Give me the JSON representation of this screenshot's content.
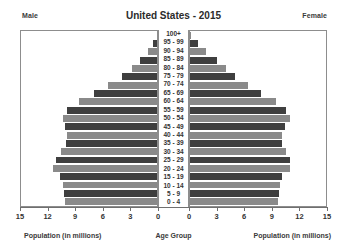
{
  "header": {
    "title": "United States - 2015",
    "male_label": "Male",
    "female_label": "Female"
  },
  "axis": {
    "left_caption": "Population (in millions)",
    "center_caption": "Age Group",
    "right_caption": "Population (in millions)",
    "ticks": [
      15,
      12,
      9,
      6,
      3,
      0
    ],
    "tick_labels_left": [
      "15",
      "12",
      "9",
      "6",
      "3",
      "0"
    ],
    "tick_labels_right": [
      "0",
      "3",
      "6",
      "9",
      "12",
      "15"
    ],
    "max": 15,
    "step": 3
  },
  "colors": {
    "bar_dark": "#3f3f3f",
    "bar_light": "#8a8a8a",
    "frame": "#8d8d8d",
    "background": "#ffffff",
    "text": "#333333"
  },
  "chart_data": {
    "type": "bar",
    "subtype": "population-pyramid",
    "title": "United States - 2015",
    "xlabel": "Population (in millions)",
    "ylabel": "Age Group",
    "xlim": [
      0,
      15
    ],
    "xticks": [
      0,
      3,
      6,
      9,
      12,
      15
    ],
    "grid": false,
    "legend": [
      "Male",
      "Female"
    ],
    "legend_position": "top-corners",
    "categories": [
      "100+",
      "95 - 99",
      "90 - 94",
      "85 - 89",
      "80 - 84",
      "75 - 79",
      "70 - 74",
      "65 - 69",
      "60 - 64",
      "55 - 59",
      "50 - 54",
      "45 - 49",
      "40 - 44",
      "35 - 39",
      "30 - 34",
      "25 - 29",
      "20 - 24",
      "15 - 19",
      "10 - 14",
      "5 - 9",
      "0 - 4"
    ],
    "series": [
      {
        "name": "Male",
        "direction": "left",
        "values": [
          0.0,
          0.4,
          1.0,
          1.9,
          2.8,
          3.9,
          5.4,
          6.9,
          8.6,
          9.9,
          10.4,
          10.1,
          9.9,
          10.0,
          10.6,
          11.1,
          11.5,
          10.7,
          10.4,
          10.3,
          10.1
        ]
      },
      {
        "name": "Female",
        "direction": "right",
        "values": [
          0.1,
          0.9,
          1.8,
          3.0,
          4.0,
          5.0,
          6.4,
          7.8,
          9.5,
          10.6,
          11.0,
          10.5,
          10.2,
          10.2,
          10.6,
          11.0,
          11.0,
          10.2,
          9.9,
          9.8,
          9.7
        ]
      }
    ]
  }
}
